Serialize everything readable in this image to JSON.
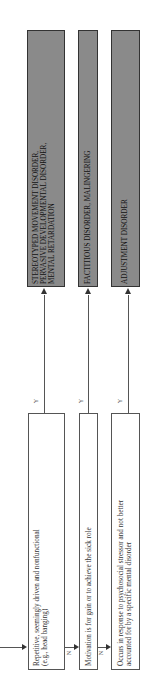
{
  "diagram": {
    "decisions": [
      {
        "id": "d1",
        "text_lines": [
          "Repetitive, seemingly driven and nonfunctional",
          "(e.g., head banging)"
        ],
        "yes_label": "Y",
        "no_label": "N"
      },
      {
        "id": "d2",
        "text_lines": [
          "Motivation is for gain or to achieve the sick role"
        ],
        "yes_label": "Y",
        "no_label": "N"
      },
      {
        "id": "d3",
        "text_lines": [
          "Occurs in response to psychosocial stressor and not better",
          "accounted for by a specific mental disorder"
        ],
        "yes_label": "Y"
      }
    ],
    "outcomes": [
      {
        "id": "o1",
        "text_lines": [
          "STEREOTYPED MOVEMENT DISORDER,",
          "PERVASIVE DEVELOPMENTAL DISORDER,",
          "MENTAL RETARDATION"
        ]
      },
      {
        "id": "o2",
        "text_lines": [
          "FACTITIOUS DISORDER, MALINGERING"
        ]
      },
      {
        "id": "o3",
        "text_lines": [
          "ADJUSTMENT DISORDER"
        ]
      }
    ]
  }
}
